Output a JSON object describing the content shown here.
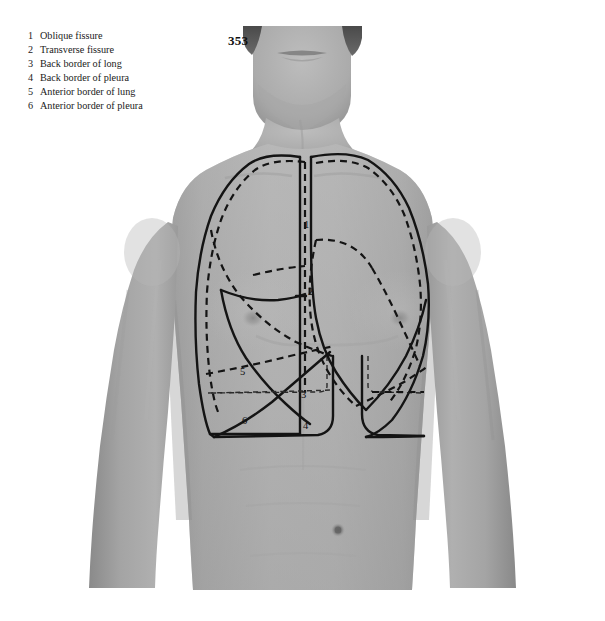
{
  "page": {
    "number": "353",
    "background_color": "#ffffff"
  },
  "legend": {
    "items": [
      {
        "num": "1",
        "label": "Oblique fissure"
      },
      {
        "num": "2",
        "label": "Transverse fissure"
      },
      {
        "num": "3",
        "label": "Back border of long"
      },
      {
        "num": "4",
        "label": "Back border of pleura"
      },
      {
        "num": "5",
        "label": "Anterior border of lung"
      },
      {
        "num": "6",
        "label": "Anterior border of pleura"
      }
    ]
  },
  "figure": {
    "line_styles": {
      "lung_border": "solid",
      "pleura_border": "dashed"
    },
    "ink_color": "#141414",
    "skin_tone": "#a9a9a9"
  },
  "callouts": [
    {
      "num": "1",
      "x": 304,
      "y": 220,
      "refers_to": "Oblique fissure"
    },
    {
      "num": "2",
      "x": 308,
      "y": 287,
      "refers_to": "Transverse fissure"
    },
    {
      "num": "3",
      "x": 301,
      "y": 390,
      "refers_to": "Back border of long"
    },
    {
      "num": "4",
      "x": 303,
      "y": 421,
      "refers_to": "Back border of pleura"
    },
    {
      "num": "5",
      "x": 240,
      "y": 367,
      "refers_to": "Anterior border of lung"
    },
    {
      "num": "6",
      "x": 242,
      "y": 416,
      "refers_to": "Anterior border of pleura"
    }
  ]
}
